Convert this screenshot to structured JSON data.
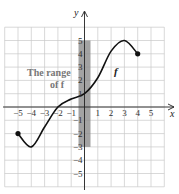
{
  "chart_data": {
    "type": "line",
    "title": "",
    "xlabel": "x",
    "ylabel": "y",
    "xlim": [
      -6,
      6
    ],
    "ylim": [
      -6,
      6
    ],
    "grid": true,
    "x_ticks": [
      "-5",
      "-4",
      "-3",
      "-2",
      "-1",
      "1",
      "2",
      "3",
      "4",
      "5"
    ],
    "y_ticks": [
      "5",
      "4",
      "3",
      "2",
      "1",
      "-1",
      "-2",
      "-3",
      "-4",
      "-5"
    ],
    "series": [
      {
        "name": "f",
        "points": [
          [
            -5,
            -2
          ],
          [
            -4,
            -3
          ],
          [
            -3,
            -1.5
          ],
          [
            -2,
            0
          ],
          [
            -1,
            0.6
          ],
          [
            0,
            1
          ],
          [
            1,
            2.2
          ],
          [
            2,
            4.2
          ],
          [
            3,
            5
          ],
          [
            4,
            4
          ]
        ],
        "endpoints_closed": [
          [
            -5,
            -2
          ],
          [
            4,
            4
          ]
        ]
      }
    ],
    "annotations": {
      "range_label_line1": "The range",
      "range_label_line2": "of f",
      "function_label": "f",
      "range_band": {
        "y_from": -3,
        "y_to": 5
      }
    }
  },
  "colors": {
    "grid": "#c8c8c8",
    "axis": "#222222",
    "curve": "#111111",
    "band": "#8c8c8c"
  }
}
